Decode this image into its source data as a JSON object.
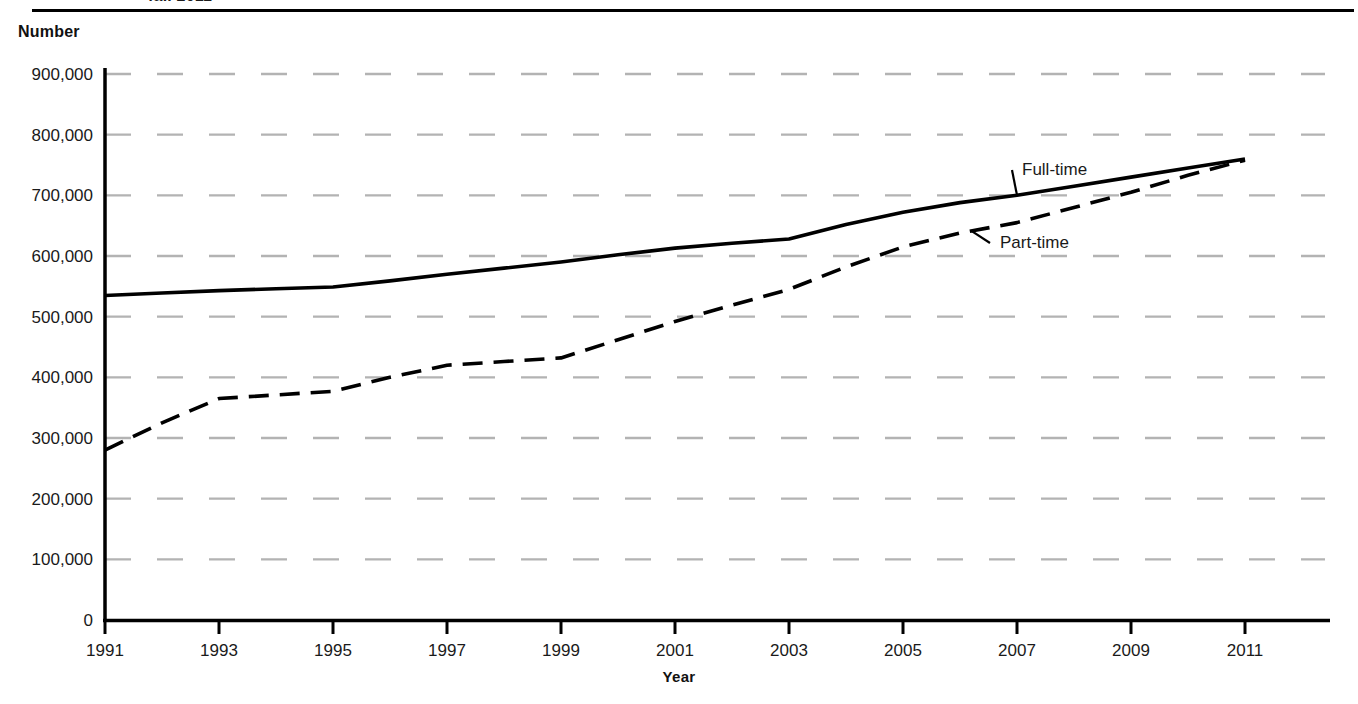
{
  "figure": {
    "title_clipped": "fall 2011",
    "y_axis_title": "Number",
    "x_axis_title": "Year"
  },
  "chart_data": {
    "type": "line",
    "title": "fall 2011",
    "xlabel": "Year",
    "ylabel": "Number",
    "xlim": [
      1991,
      2011
    ],
    "ylim": [
      0,
      900000
    ],
    "grid": true,
    "grid_style": "dashed-light-gray",
    "legend_position": "inline-annotations",
    "x": [
      1991,
      1992,
      1993,
      1994,
      1995,
      1996,
      1997,
      1998,
      1999,
      2000,
      2001,
      2002,
      2003,
      2004,
      2005,
      2006,
      2007,
      2008,
      2009,
      2010,
      2011
    ],
    "x_tick_labels": [
      "1991",
      "1993",
      "1995",
      "1997",
      "1999",
      "2001",
      "2003",
      "2005",
      "2007",
      "2009",
      "2011"
    ],
    "y_tick_labels": [
      "0",
      "100,000",
      "200,000",
      "300,000",
      "400,000",
      "500,000",
      "600,000",
      "700,000",
      "800,000",
      "900,000"
    ],
    "y_tick_values": [
      0,
      100000,
      200000,
      300000,
      400000,
      500000,
      600000,
      700000,
      800000,
      900000
    ],
    "series": [
      {
        "name": "Full-time",
        "line_style": "solid",
        "color": "#000000",
        "values": [
          535000,
          539000,
          543000,
          546000,
          549000,
          559000,
          570000,
          580000,
          590000,
          602000,
          613000,
          621000,
          628000,
          652000,
          672000,
          688000,
          700000,
          715000,
          730000,
          745000,
          760000
        ]
      },
      {
        "name": "Part-time",
        "line_style": "dashed",
        "color": "#000000",
        "values": [
          280000,
          325000,
          365000,
          371000,
          377000,
          400000,
          420000,
          426000,
          432000,
          462000,
          492000,
          519000,
          545000,
          582000,
          615000,
          638000,
          655000,
          680000,
          705000,
          733000,
          758000
        ]
      }
    ],
    "annotations": [
      {
        "text": "Full-time",
        "series": "Full-time",
        "x": 2007.0,
        "label_px": [
          1022,
          175
        ]
      },
      {
        "text": "Part-time",
        "series": "Part-time",
        "x": 2006.2,
        "label_px": [
          1000,
          248
        ]
      }
    ]
  }
}
